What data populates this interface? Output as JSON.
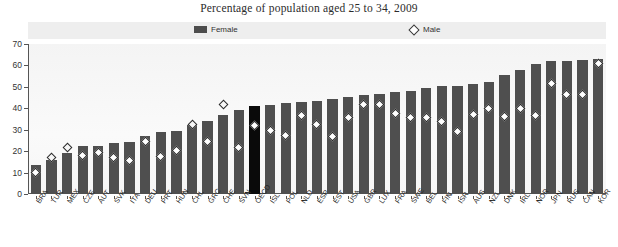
{
  "chart_data": {
    "type": "bar",
    "title": "Percentage of  population aged 25 to 34, 2009",
    "xlabel": "",
    "ylabel": "",
    "ylim": [
      0,
      70
    ],
    "yticks": [
      0,
      10,
      20,
      30,
      40,
      50,
      60,
      70
    ],
    "grid": false,
    "legend_position": "top",
    "highlight_category": "OECD",
    "colors": {
      "female_bar": "#4f4f4f",
      "highlight_bar": "#0a0a0a",
      "male_marker_fill": "#ffffff",
      "male_marker_edge": "#2a2a2a",
      "plot_background": "#f7f7f7",
      "legend_background": "#eeeeee"
    },
    "legend": [
      {
        "name": "Female",
        "marker": "bar-swatch"
      },
      {
        "name": "Male",
        "marker": "open-diamond"
      }
    ],
    "categories": [
      "BRA",
      "TUR",
      "MEX",
      "CZE",
      "AUT",
      "SVK",
      "ITA",
      "DEU",
      "PRT",
      "HUN",
      "CHL",
      "GRC",
      "CHE",
      "SVN",
      "OECD",
      "ISL",
      "POL",
      "NLD",
      "ESP",
      "EST",
      "USA",
      "GBR",
      "LUX",
      "FRA",
      "SWE",
      "BEL",
      "FIN",
      "ISR",
      "AUS",
      "NZL",
      "DNK",
      "IRL",
      "NOR",
      "JPN",
      "RUS",
      "CAN",
      "KOR"
    ],
    "series": [
      {
        "name": "Female",
        "values": [
          13.5,
          16.0,
          19.0,
          22.5,
          22.5,
          24.0,
          24.5,
          27.0,
          29.0,
          29.5,
          32.0,
          34.0,
          37.0,
          39.0,
          41.0,
          41.5,
          42.5,
          43.0,
          43.5,
          44.5,
          45.5,
          46.0,
          46.5,
          47.5,
          48.0,
          49.5,
          50.5,
          50.5,
          51.5,
          52.5,
          55.5,
          58.0,
          60.5,
          62.0,
          62.0,
          62.5,
          63.0
        ]
      },
      {
        "name": "Male",
        "values": [
          10.0,
          17.0,
          21.5,
          18.0,
          19.5,
          17.0,
          15.5,
          24.5,
          17.5,
          20.5,
          32.5,
          24.5,
          42.0,
          21.5,
          32.0,
          29.5,
          27.5,
          36.5,
          32.5,
          27.0,
          35.5,
          42.0,
          42.0,
          37.5,
          35.5,
          35.5,
          34.0,
          29.0,
          37.0,
          40.0,
          36.0,
          40.0,
          36.5,
          51.5,
          46.5,
          46.5,
          61.0
        ]
      }
    ]
  }
}
